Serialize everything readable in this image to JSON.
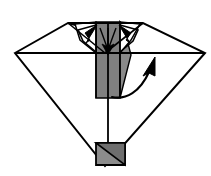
{
  "figure": {
    "description": "Symmetric diamond / kite shaped paper model seen from the front with a dark grey vertical centre panel, two small downward fold arrows at the top and one large curved valley-fold arrow at the right.",
    "type": "origami-step-diagram",
    "canvas": {
      "width": 211,
      "height": 176
    },
    "colors": {
      "background": "#ffffff",
      "paper_front": "#ffffff",
      "paper_back_grey": "#808080",
      "paper_back_grey_dark": "#6e6e6e",
      "outline": "#000000",
      "arrow_fill": "#000000"
    },
    "stroke": {
      "outline_width": 2.0,
      "crease_width": 1.6,
      "thin_width": 1.3
    },
    "shapes": {
      "outer_kite": {
        "name": "outer-kite-outline",
        "points": "15,53 68,23 105,33 143,23 205,53 105,166 15,53"
      },
      "upper_left_wing": {
        "name": "upper-left-wing",
        "points": "15,53 68,23 105,53"
      },
      "upper_right_wing": {
        "name": "upper-right-wing",
        "points": "143,23 205,53 105,53"
      },
      "lower_body": {
        "name": "lower-body-triangle",
        "points": "15,53 205,53 105,166"
      },
      "grey_column": {
        "name": "grey-centre-column",
        "points": "96,22 120,22 120,98 96,98"
      },
      "grey_column_inner_taper": {
        "name": "grey-column-taper",
        "points": "120,22 120,98 131,55 124,28"
      },
      "grey_tab_bottom": {
        "name": "grey-bottom-tab",
        "points": "96,143 125,143 125,165 96,165"
      },
      "grey_tab_bottom_dark": {
        "name": "grey-bottom-tab-dark-triangle",
        "points": "96,143 125,143 125,165"
      },
      "centre_stem": {
        "name": "centre-vertical-stem",
        "points": "108,22 108,165"
      },
      "left_notch": {
        "name": "left-notch-triangle",
        "points": "75,24 96,22 96,53 80,40"
      },
      "right_notch": {
        "name": "right-notch-triangle",
        "points": "120,22 140,24 131,40 120,53"
      }
    },
    "arrows": [
      {
        "id": "arrow-fold-left",
        "name": "fold-arrow-left",
        "label": "small fold arrow, upper left, pointing down-left",
        "direction": "down-left",
        "tail": "96,26",
        "head": "84,40"
      },
      {
        "id": "arrow-fold-right",
        "name": "fold-arrow-right",
        "label": "small fold arrow, upper right, pointing down-right",
        "direction": "down-right",
        "tail": "120,26",
        "head": "132,40"
      },
      {
        "id": "arrow-fold-centre",
        "name": "fold-arrow-centre",
        "label": "small fold arrow in centre pointing straight down",
        "direction": "down",
        "tail": "108,28",
        "head": "108,52"
      },
      {
        "id": "arrow-valley-main",
        "name": "valley-fold-curved-arrow",
        "label": "large curved valley-fold arrow sweeping from lower centre up to the right",
        "direction": "curve-up-right",
        "tail": "112,96",
        "head": "155,58"
      }
    ],
    "creases": [
      {
        "name": "horizontal-centre-crease",
        "points": "15,53 205,53"
      },
      {
        "name": "left-wing-crease",
        "points": "68,23 105,53"
      },
      {
        "name": "right-wing-crease",
        "points": "143,23 105,53"
      },
      {
        "name": "top-edge-crease",
        "points": "68,23 143,23"
      },
      {
        "name": "grey-column-left-crease",
        "points": "96,22 96,98"
      },
      {
        "name": "grey-column-right-crease",
        "points": "120,22 120,98"
      }
    ]
  }
}
